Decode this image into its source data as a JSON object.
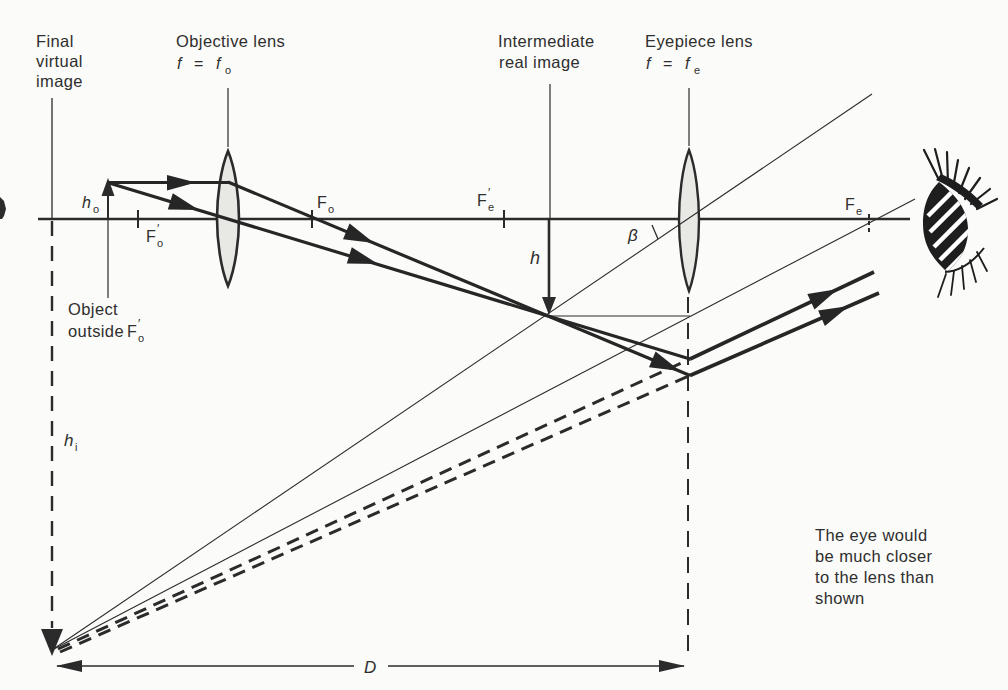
{
  "figure": {
    "type": "compound-microscope-ray-diagram",
    "background": "#fbfbf9",
    "ink": "#2b2b2b",
    "lens_fill": "#e8e8e5"
  },
  "labels": {
    "final_image": {
      "line1": "Final",
      "line2": "virtual",
      "line3": "image"
    },
    "objective": {
      "title": "Objective lens",
      "f": "f",
      "eq": "=",
      "f2": "f",
      "sub": "o"
    },
    "intermediate": {
      "line1": "Intermediate",
      "line2": "real image"
    },
    "eyepiece": {
      "title": "Eyepiece lens",
      "f": "f",
      "eq": "=",
      "f2": "f",
      "sub": "e"
    },
    "object": {
      "line1": "Object",
      "line2": "outside",
      "F": "F",
      "sub": "o",
      "prime": "′"
    },
    "note": {
      "line1": "The eye would",
      "line2": "be much closer",
      "line3": "to the lens than",
      "line4": "shown"
    }
  },
  "symbols": {
    "h_o": {
      "main": "h",
      "sub": "o"
    },
    "h": {
      "main": "h"
    },
    "h_i": {
      "main": "h",
      "sub": "i"
    },
    "beta": {
      "main": "β"
    },
    "D": {
      "main": "D"
    },
    "F_o_prime": {
      "main": "F",
      "sub": "o",
      "prime": "′"
    },
    "F_o": {
      "main": "F",
      "sub": "o"
    },
    "F_e_prime": {
      "main": "F",
      "sub": "e",
      "prime": "′"
    },
    "F_e": {
      "main": "F",
      "sub": "e"
    }
  }
}
